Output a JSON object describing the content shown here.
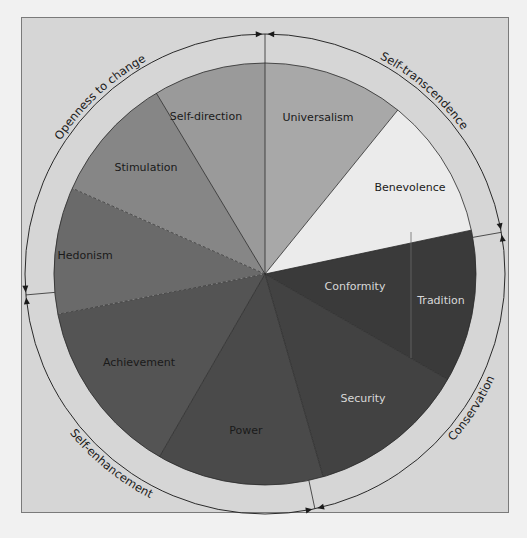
{
  "diagram": {
    "type": "circular value model",
    "center": [
      265,
      274
    ],
    "radius": 211,
    "outer_radius": 240,
    "segments": [
      {
        "name": "Self-direction",
        "start": 329,
        "end": 360,
        "fill": "#9a9a9a",
        "text": "#1a1a1a",
        "label_pos": [
          206,
          120
        ]
      },
      {
        "name": "Universalism",
        "start": 0,
        "end": 39,
        "fill": "#a8a8a8",
        "text": "#1a1a1a",
        "label_pos": [
          318,
          121
        ]
      },
      {
        "name": "Benevolence",
        "start": 39,
        "end": 78,
        "fill": "#ebebeb",
        "text": "#1a1a1a",
        "label_pos": [
          410,
          191
        ]
      },
      {
        "name": "Conformity",
        "start": 78,
        "end": 120,
        "fill": "#3a3a3a",
        "text": "#d8d8d8",
        "label_pos": [
          355,
          290
        ]
      },
      {
        "name": "Tradition",
        "start": 78,
        "end": 120,
        "fill": "#3a3a3a",
        "text": "#d8d8d8",
        "label_pos": [
          441,
          304
        ]
      },
      {
        "name": "Security",
        "start": 120,
        "end": 164,
        "fill": "#424242",
        "text": "#d8d8d8",
        "label_pos": [
          363,
          402
        ]
      },
      {
        "name": "Power",
        "start": 164,
        "end": 210,
        "fill": "#4a4a4a",
        "text": "#1a1a1a",
        "label_pos": [
          246,
          434
        ]
      },
      {
        "name": "Achievement",
        "start": 210,
        "end": 259,
        "fill": "#545454",
        "text": "#1a1a1a",
        "label_pos": [
          139,
          366
        ]
      },
      {
        "name": "Hedonism",
        "start": 259,
        "end": 294,
        "fill": "#6a6a6a",
        "text": "#1a1a1a",
        "label_pos": [
          85,
          259
        ]
      },
      {
        "name": "Stimulation",
        "start": 294,
        "end": 329,
        "fill": "#868686",
        "text": "#1a1a1a",
        "label_pos": [
          146,
          171
        ]
      }
    ],
    "higher_order": [
      {
        "name": "Openness to change",
        "from": 265,
        "to": 360
      },
      {
        "name": "Self-transcendence",
        "from": 0,
        "to": 80
      },
      {
        "name": "Conservation",
        "from": 80,
        "to": 168
      },
      {
        "name": "Self-enhancement",
        "from": 168,
        "to": 265
      }
    ],
    "dashed_boundaries": [
      259,
      294
    ],
    "colors": {
      "frame_bg": "#d6d6d6",
      "page_bg": "#f1f1f1",
      "line": "#2a2a2a"
    }
  }
}
